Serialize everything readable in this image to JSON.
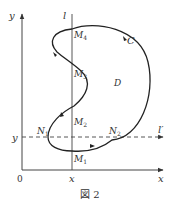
{
  "figure": {
    "caption": "図 2",
    "colors": {
      "ink": "#333333",
      "background": "#ffffff"
    }
  },
  "axes": {
    "x_label": "x",
    "y_label": "y",
    "origin_label": "0",
    "x_tick_label": "x",
    "y_tick_label": "y"
  },
  "lines": {
    "vertical_label": "l",
    "horizontal_dashed_label": "l′"
  },
  "curve": {
    "label": "C",
    "region_label": "D"
  },
  "points": {
    "M1": {
      "base": "M",
      "sub": "1"
    },
    "M2": {
      "base": "M",
      "sub": "2"
    },
    "M3": {
      "base": "M",
      "sub": "3"
    },
    "M4": {
      "base": "M",
      "sub": "4"
    },
    "N1": {
      "base": "N",
      "sub": "1"
    },
    "N2": {
      "base": "N",
      "sub": "2"
    }
  }
}
